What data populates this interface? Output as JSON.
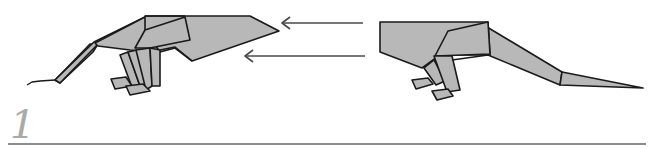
{
  "diagram": {
    "type": "origami-instruction-step",
    "step": {
      "number": "1"
    },
    "colors": {
      "paper_fill": "#b8b8b8",
      "outline": "#1a1a1a",
      "arrow": "#4a4a4a",
      "step_number": "#a9a9a9",
      "rule": "#8c8c8c",
      "background": "#ffffff"
    },
    "figures": [
      {
        "id": "left-model",
        "description": "origami dinosaur facing right (head on right, long snout/tail extending left)"
      },
      {
        "id": "right-model",
        "description": "origami dinosaur facing left (head block on left, long tail extending right)"
      }
    ],
    "arrows": [
      {
        "id": "arrow-upper",
        "direction": "left"
      },
      {
        "id": "arrow-lower",
        "direction": "left"
      }
    ]
  }
}
